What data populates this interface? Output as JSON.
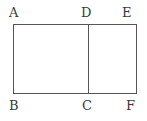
{
  "figure": {
    "type": "geometry-diagram",
    "background_color": "#ffffff",
    "stroke_color": "#555555",
    "stroke_width": 1,
    "label_color": "#3a3a3a",
    "rectangle": {
      "left": 13,
      "top": 24,
      "right": 137,
      "bottom": 93,
      "width": 124,
      "height": 69
    },
    "divider": {
      "name": "segment-dc",
      "x": 88,
      "y_top": 24,
      "y_bottom": 93
    },
    "labels": [
      {
        "id": "A",
        "text": "A",
        "x": 9,
        "y": 6,
        "corner": "top-left"
      },
      {
        "id": "D",
        "text": "D",
        "x": 81,
        "y": 6,
        "corner": "top-middle"
      },
      {
        "id": "E",
        "text": "E",
        "x": 122,
        "y": 6,
        "corner": "top-right"
      },
      {
        "id": "B",
        "text": "B",
        "x": 9,
        "y": 99,
        "corner": "bottom-left"
      },
      {
        "id": "C",
        "text": "C",
        "x": 82,
        "y": 99,
        "corner": "bottom-middle"
      },
      {
        "id": "F",
        "text": "F",
        "x": 126,
        "y": 99,
        "corner": "bottom-right"
      }
    ]
  }
}
